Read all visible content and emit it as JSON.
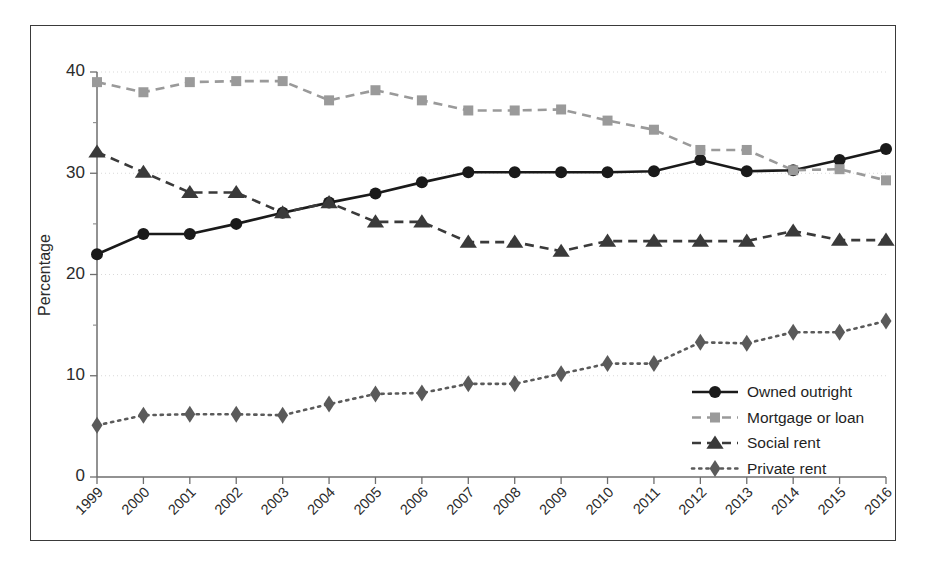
{
  "chart_data": {
    "type": "line",
    "title": "",
    "subtitle": "",
    "xlabel": "",
    "ylabel": "Percentage",
    "xlim": [
      1999,
      2016
    ],
    "ylim": [
      0,
      40
    ],
    "yticks": [
      0,
      10,
      20,
      30,
      40
    ],
    "ytick_labels": [
      "0",
      "10",
      "20",
      "30",
      "40"
    ],
    "yminor_ticks": [
      5,
      15,
      25,
      35
    ],
    "grid": "horizontal-dotted",
    "legend_position": "lower-right-inside",
    "categories": [
      1999,
      2000,
      2001,
      2002,
      2003,
      2004,
      2005,
      2006,
      2007,
      2008,
      2009,
      2010,
      2011,
      2012,
      2013,
      2014,
      2015,
      2016
    ],
    "xtick_labels": [
      "1999",
      "2000",
      "2001",
      "2002",
      "2003",
      "2004",
      "2005",
      "2006",
      "2007",
      "2008",
      "2009",
      "2010",
      "2011",
      "2012",
      "2013",
      "2014",
      "2015",
      "2016"
    ],
    "xtick_rotation": 45,
    "series": [
      {
        "name": "Owned outright",
        "color": "#1a1a1a",
        "marker": "circle",
        "dash": "none",
        "values": [
          22.0,
          24.0,
          24.0,
          25.0,
          26.1,
          27.1,
          28.0,
          29.1,
          30.1,
          30.1,
          30.1,
          30.1,
          30.2,
          31.3,
          30.2,
          30.3,
          31.3,
          32.4
        ]
      },
      {
        "name": "Mortgage or loan",
        "color": "#9a9a9a",
        "marker": "square",
        "dash": "dashed",
        "values": [
          39.0,
          38.0,
          39.0,
          39.1,
          39.1,
          37.2,
          38.2,
          37.2,
          36.2,
          36.2,
          36.3,
          35.2,
          34.3,
          32.3,
          32.3,
          30.3,
          30.4,
          29.3
        ]
      },
      {
        "name": "Social rent",
        "color": "#3a3a3a",
        "marker": "triangle",
        "dash": "dashed",
        "values": [
          32.1,
          30.1,
          28.1,
          28.1,
          26.1,
          27.1,
          25.2,
          25.2,
          23.2,
          23.2,
          22.3,
          23.3,
          23.3,
          23.3,
          23.3,
          24.3,
          23.4,
          23.4
        ]
      },
      {
        "name": "Private rent",
        "color": "#5a5a5a",
        "marker": "diamond",
        "dash": "dotted",
        "values": [
          5.1,
          6.1,
          6.2,
          6.2,
          6.1,
          7.2,
          8.2,
          8.3,
          9.2,
          9.2,
          10.2,
          11.2,
          11.2,
          13.3,
          13.2,
          14.3,
          14.3,
          15.4
        ]
      }
    ]
  },
  "legend": {
    "items": [
      {
        "label": "Owned outright"
      },
      {
        "label": "Mortgage or loan"
      },
      {
        "label": "Social rent"
      },
      {
        "label": "Private rent"
      }
    ]
  },
  "colors": {
    "frame": "#3a3a3a",
    "axis": "#6e6e6e",
    "grid": "#d9d9d9",
    "background": "#ffffff",
    "owned_outright": "#1a1a1a",
    "mortgage_or_loan": "#9a9a9a",
    "social_rent": "#3a3a3a",
    "private_rent": "#5a5a5a"
  }
}
